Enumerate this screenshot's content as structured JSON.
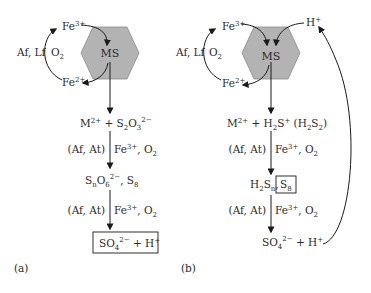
{
  "diagram": {
    "colors": {
      "hexagon_fill": "#b3b3b3",
      "hexagon_stroke": "#8c8c8c",
      "line": "#1a1a1a",
      "text": "#2a2a2a",
      "background": "#ffffff"
    },
    "panel_a": {
      "label": "(a)",
      "mineral": "MS",
      "fe3": "Fe",
      "fe3_charge": "3+",
      "fe2": "Fe",
      "fe2_charge": "2+",
      "cycle_agents": "Af, Lf",
      "cycle_oxidant": "O",
      "cycle_oxidant_sub": "2",
      "step1": {
        "m": "M",
        "m_charge": "2+",
        "plus": " + S",
        "s_sub": "2",
        "o": "O",
        "o_sub": "3",
        "charge": "2−"
      },
      "arrow1_agents": "(Af, At)",
      "arrow1_oxidants": "Fe",
      "arrow1_fe_charge": "3+",
      "arrow1_o2": ", O",
      "arrow1_o2_sub": "2",
      "step2": {
        "s": "S",
        "s_sub": "n",
        "o": "O",
        "o_sub": "6",
        "charge": "2−",
        "tail": ", S",
        "tail_sub": "8"
      },
      "arrow2_agents": "(Af, At)",
      "arrow2_oxidants": "Fe",
      "arrow2_fe_charge": "3+",
      "arrow2_o2": ", O",
      "arrow2_o2_sub": "2",
      "product": {
        "so": "SO",
        "so_sub": "4",
        "charge": "2−",
        "plus": " + H",
        "h_charge": "+"
      }
    },
    "panel_b": {
      "label": "(b)",
      "mineral": "MS",
      "fe3": "Fe",
      "fe3_charge": "3+",
      "fe2": "Fe",
      "fe2_charge": "2+",
      "proton": "H",
      "proton_charge": "+",
      "cycle_agents": "Af, Lf",
      "cycle_oxidant": "O",
      "cycle_oxidant_sub": "2",
      "step1": {
        "m": "M",
        "m_charge": "2+",
        "plus": " + H",
        "h_sub": "2",
        "s": "S",
        "s_charge": "+",
        "paren": " (H",
        "paren_sub1": "2",
        "paren_s": "S",
        "paren_sub2": "2",
        "paren_close": ")"
      },
      "arrow1_agents": "(Af, At)",
      "arrow1_oxidants": "Fe",
      "arrow1_fe_charge": "3+",
      "arrow1_o2": ", O",
      "arrow1_o2_sub": "2",
      "step2": {
        "h": "H",
        "h_sub": "2",
        "s": "S",
        "s_sub": "n",
        "comma": ",",
        "boxed": "S",
        "boxed_sub": "8"
      },
      "arrow2_agents": "(Af, At)",
      "arrow2_oxidants": "Fe",
      "arrow2_fe_charge": "3+",
      "arrow2_o2": ", O",
      "arrow2_o2_sub": "2",
      "product": {
        "so": "SO",
        "so_sub": "4",
        "charge": "2−",
        "plus": " + H",
        "h_charge": "+"
      }
    }
  }
}
